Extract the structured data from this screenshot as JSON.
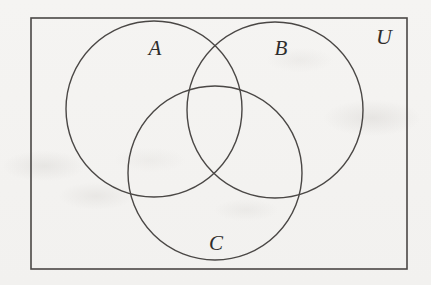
{
  "figure": {
    "kind": "venn-diagram",
    "background_color": "#f2f1ef",
    "stroke_color": "#4a4745",
    "label_color": "#2e2c2b",
    "canvas": {
      "width": 431,
      "height": 285
    }
  },
  "universe": {
    "label": "U",
    "label_x": 384,
    "label_y": 37,
    "label_font_size": 22,
    "rect": {
      "x": 31,
      "y": 18,
      "width": 376,
      "height": 251
    },
    "stroke_width": 1.6
  },
  "circles": [
    {
      "id": "circle-a",
      "label": "A",
      "cx": 154,
      "cy": 109,
      "r": 88,
      "label_x": 155,
      "label_y": 48,
      "label_font_size": 21,
      "stroke_width": 1.4
    },
    {
      "id": "circle-b",
      "label": "B",
      "cx": 275,
      "cy": 110,
      "r": 88,
      "label_x": 281,
      "label_y": 48,
      "label_font_size": 21,
      "stroke_width": 1.4
    },
    {
      "id": "circle-c",
      "label": "C",
      "cx": 215,
      "cy": 173,
      "r": 87,
      "label_x": 216,
      "label_y": 243,
      "label_font_size": 21,
      "stroke_width": 1.4
    }
  ],
  "chart_data": {
    "type": "diagram",
    "title": "",
    "diagram_type": "venn",
    "set_count": 3,
    "sets": [
      "A",
      "B",
      "C"
    ],
    "universe_label": "U",
    "regions": [
      "A only",
      "B only",
      "C only",
      "A and B",
      "A and C",
      "B and C",
      "A and B and C",
      "outside all sets (within U)"
    ],
    "shaded_regions": [],
    "labels": [
      "A",
      "B",
      "C",
      "U"
    ],
    "legend": "none",
    "grid": false
  }
}
